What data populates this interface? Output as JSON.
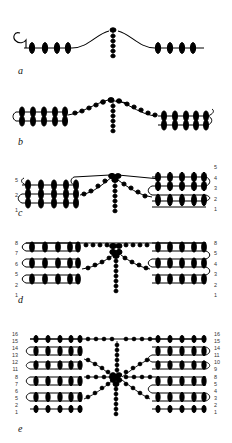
{
  "figure": {
    "title": "",
    "background_color": "#ffffff",
    "ink_color": "#000000",
    "width": 232,
    "height": 443,
    "panel_count": 5
  },
  "panels": [
    {
      "id": "a",
      "label": "a",
      "description": "single thread row with beads, curl at left end, central raised loop with vertical bead chain",
      "rows_left": [],
      "rows_right": [],
      "bead_rows": 1,
      "left_beads": 4,
      "right_beads": 4,
      "vertical_beads": 5
    },
    {
      "id": "b",
      "label": "b",
      "description": "two stacked bead rows, arch in the middle with vertical bead chain, curl at right end",
      "rows_left": [],
      "rows_right": [],
      "bead_rows": 2,
      "left_beads": 5,
      "right_beads": 5,
      "vertical_beads": 6
    },
    {
      "id": "c",
      "label": "c",
      "description": "left block of three rows and right block of five rows joined at a central cluster with a vertical bead chain",
      "rows_left": [
        "5",
        "2",
        "1"
      ],
      "rows_right": [
        "5",
        "4",
        "3",
        "2",
        "1"
      ],
      "bead_rows": 5,
      "left_beads": 5,
      "right_beads": 5,
      "vertical_beads": 6
    },
    {
      "id": "d",
      "label": "d",
      "description": "left block labelled 8 7 6 5 2 1 and right block labelled 8 5 4 3 2 1, joined at central cluster with vertical bead chain",
      "rows_left": [
        "8",
        "7",
        "6",
        "5",
        "2",
        "1"
      ],
      "rows_right": [
        "8",
        "5",
        "4",
        "3",
        "2",
        "1"
      ],
      "bead_rows": 8,
      "left_beads": 6,
      "right_beads": 6,
      "vertical_beads": 7
    },
    {
      "id": "e",
      "label": "e",
      "description": "largest diagram, left block labelled 16 15 14 13 12 11 8 7 6 5 2 1 and right block labelled 16 15 14 11 10 9 8 5 4 3 2 1, joined at dense central cluster with vertical bead chain",
      "rows_left": [
        "16",
        "15",
        "14",
        "13",
        "12",
        "11",
        "8",
        "7",
        "6",
        "5",
        "2",
        "1"
      ],
      "rows_right": [
        "16",
        "15",
        "14",
        "11",
        "10",
        "9",
        "8",
        "5",
        "4",
        "3",
        "2",
        "1"
      ],
      "bead_rows": 16,
      "left_beads": 7,
      "right_beads": 7,
      "vertical_beads": 9
    }
  ]
}
